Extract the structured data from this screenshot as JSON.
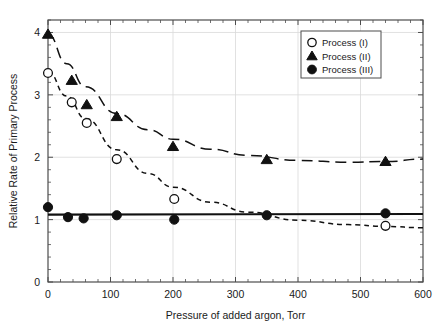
{
  "chart_data": {
    "type": "scatter",
    "title": "",
    "xlabel": "Pressure of added argon, Torr",
    "ylabel": "Relative Rate of Primary Process",
    "xlim": [
      0,
      600
    ],
    "ylim": [
      0,
      4.2
    ],
    "xticks": [
      0,
      100,
      200,
      300,
      400,
      500,
      600
    ],
    "xtick_labels": [
      "0",
      "100",
      "200",
      "300",
      "400",
      "500",
      "600"
    ],
    "yticks": [
      0,
      1,
      2,
      3,
      4
    ],
    "ytick_labels": [
      "0",
      "1",
      "2",
      "3",
      "4"
    ],
    "x_minor_tick_step": 20,
    "y_minor_tick_step": 0.2,
    "grid": "major-gridlines-light-gray",
    "legend_position": "top-right-inside",
    "series": [
      {
        "name": "Process (I)",
        "marker": "open-circle",
        "linestyle": "short-dashed",
        "points": [
          {
            "x": 0,
            "y": 3.35
          },
          {
            "x": 38,
            "y": 2.88
          },
          {
            "x": 62,
            "y": 2.55
          },
          {
            "x": 110,
            "y": 1.97
          },
          {
            "x": 202,
            "y": 1.33
          },
          {
            "x": 540,
            "y": 0.9
          }
        ]
      },
      {
        "name": "Process (II)",
        "marker": "filled-triangle",
        "linestyle": "long-dashed",
        "points": [
          {
            "x": 0,
            "y": 3.97
          },
          {
            "x": 38,
            "y": 3.23
          },
          {
            "x": 62,
            "y": 2.84
          },
          {
            "x": 110,
            "y": 2.65
          },
          {
            "x": 200,
            "y": 2.17
          },
          {
            "x": 350,
            "y": 1.96
          },
          {
            "x": 540,
            "y": 1.93
          }
        ]
      },
      {
        "name": "Process (III)",
        "marker": "filled-circle",
        "linestyle": "solid",
        "points": [
          {
            "x": 0,
            "y": 1.2
          },
          {
            "x": 32,
            "y": 1.04
          },
          {
            "x": 57,
            "y": 1.02
          },
          {
            "x": 110,
            "y": 1.07
          },
          {
            "x": 202,
            "y": 1.0
          },
          {
            "x": 350,
            "y": 1.07
          },
          {
            "x": 540,
            "y": 1.1
          }
        ]
      }
    ],
    "fit_curves": [
      {
        "name": "Process (I) fit",
        "style": "short-dashed",
        "path_points": [
          {
            "x": 0,
            "y": 3.37
          },
          {
            "x": 30,
            "y": 2.98
          },
          {
            "x": 60,
            "y": 2.62
          },
          {
            "x": 110,
            "y": 2.12
          },
          {
            "x": 160,
            "y": 1.74
          },
          {
            "x": 200,
            "y": 1.52
          },
          {
            "x": 260,
            "y": 1.28
          },
          {
            "x": 320,
            "y": 1.12
          },
          {
            "x": 400,
            "y": 0.99
          },
          {
            "x": 480,
            "y": 0.92
          },
          {
            "x": 540,
            "y": 0.89
          },
          {
            "x": 600,
            "y": 0.87
          }
        ]
      },
      {
        "name": "Process (II) fit",
        "style": "long-dashed",
        "path_points": [
          {
            "x": 0,
            "y": 3.97
          },
          {
            "x": 30,
            "y": 3.5
          },
          {
            "x": 60,
            "y": 3.13
          },
          {
            "x": 110,
            "y": 2.7
          },
          {
            "x": 160,
            "y": 2.44
          },
          {
            "x": 200,
            "y": 2.29
          },
          {
            "x": 260,
            "y": 2.13
          },
          {
            "x": 320,
            "y": 2.03
          },
          {
            "x": 400,
            "y": 1.95
          },
          {
            "x": 480,
            "y": 1.92
          },
          {
            "x": 540,
            "y": 1.93
          },
          {
            "x": 600,
            "y": 1.97
          }
        ]
      },
      {
        "name": "Process (III) fit",
        "style": "solid",
        "path_points": [
          {
            "x": 0,
            "y": 1.08
          },
          {
            "x": 600,
            "y": 1.09
          }
        ]
      }
    ],
    "legend": [
      {
        "label": "Process (I)",
        "marker": "open-circle"
      },
      {
        "label": "Process (II)",
        "marker": "filled-triangle"
      },
      {
        "label": "Process (III)",
        "marker": "filled-circle"
      }
    ]
  }
}
